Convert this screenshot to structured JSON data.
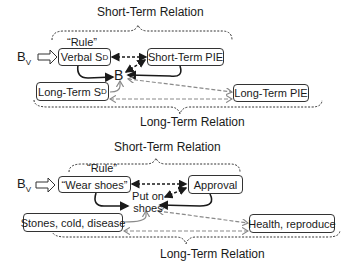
{
  "diagrams": [
    {
      "short_term_label": "Short-Term Relation",
      "long_term_label": "Long-Term Relation",
      "rule_label": "“Rule”",
      "bv_label": "B",
      "bv_sub": "V",
      "rule_box": {
        "text": "Verbal S",
        "sup": "D"
      },
      "short_term_box": {
        "text": "Short-Term PIE"
      },
      "long_term_box_left": {
        "text": "Long-Term S",
        "sup": "D"
      },
      "long_term_box_right": {
        "text": "Long-Term PIE"
      },
      "behavior_label": "B"
    },
    {
      "short_term_label": "Short-Term Relation",
      "long_term_label": "Long-Term Relation",
      "rule_label": "“Rule”",
      "bv_label": "B",
      "bv_sub": "V",
      "rule_box": {
        "text": "“Wear shoes”"
      },
      "short_term_box": {
        "text": "Approval"
      },
      "long_term_box_left": {
        "text": "Stones, cold, disease"
      },
      "long_term_box_right": {
        "text": "Health, reproduce"
      },
      "behavior_label_line1": "Put on",
      "behavior_label_line2": "shoes"
    }
  ],
  "colors": {
    "solid_arrow": "#1a1a1a",
    "gray_arrow": "#8a8a8a",
    "box_border": "#333333"
  }
}
